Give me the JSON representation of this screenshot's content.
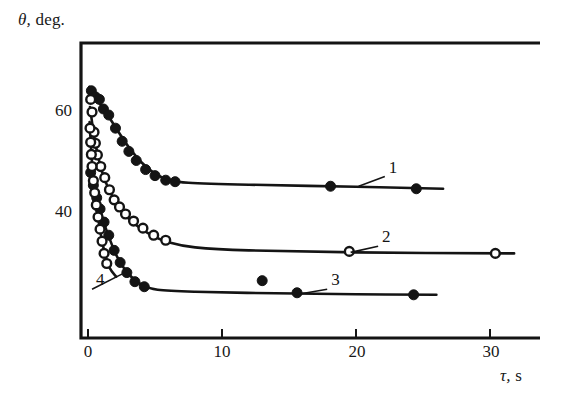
{
  "figure": {
    "background_color": "#ffffff",
    "ink_color": "#141414"
  },
  "axes": {
    "y_title": "θ,",
    "y_title_unit": "deg.",
    "x_title": "τ,",
    "x_title_unit": "s",
    "x_ticks": [
      "0",
      "10",
      "20",
      "30"
    ],
    "y_ticks": [
      "60",
      "40"
    ]
  },
  "curve_labels": [
    {
      "text": "1"
    },
    {
      "text": "2"
    },
    {
      "text": "3"
    },
    {
      "text": "4"
    }
  ],
  "chart_data": {
    "type": "scatter",
    "title": "",
    "subtitle": "",
    "xlabel": "τ, s",
    "ylabel": "θ, deg.",
    "xlim": [
      -0.6,
      33.7
    ],
    "ylim": [
      19.5,
      71.5
    ],
    "x_ticks": [
      0,
      10,
      20,
      30
    ],
    "y_ticks": [
      40,
      60
    ],
    "grid": false,
    "legend": "inline-curve-numbers",
    "annotations": [
      {
        "label": "1",
        "x": 22.3,
        "y": 47.8,
        "points_to": {
          "x": 20.2,
          "y": 45.3
        }
      },
      {
        "label": "2",
        "x": 21.8,
        "y": 34.0,
        "points_to": {
          "x": 19.6,
          "y": 32.2
        }
      },
      {
        "label": "3",
        "x": 18.0,
        "y": 25.5,
        "points_to": {
          "x": 15.9,
          "y": 24.0
        }
      },
      {
        "label": "4",
        "x": 0.45,
        "y": 25.5,
        "points_to": {
          "x": 2.6,
          "y": 28.0
        }
      }
    ],
    "series": [
      {
        "name": "1",
        "marker": "filled-circle",
        "marker_color": "#141414",
        "points": [
          {
            "x": 0.25,
            "y": 64.2
          },
          {
            "x": 0.55,
            "y": 63.0
          },
          {
            "x": 0.85,
            "y": 62.5
          },
          {
            "x": 1.15,
            "y": 60.6
          },
          {
            "x": 1.55,
            "y": 59.4
          },
          {
            "x": 2.05,
            "y": 56.8
          },
          {
            "x": 2.55,
            "y": 54.2
          },
          {
            "x": 3.05,
            "y": 52.2
          },
          {
            "x": 3.6,
            "y": 50.4
          },
          {
            "x": 4.3,
            "y": 48.6
          },
          {
            "x": 5.0,
            "y": 47.4
          },
          {
            "x": 5.8,
            "y": 46.5
          },
          {
            "x": 6.5,
            "y": 46.2
          },
          {
            "x": 18.1,
            "y": 45.3
          },
          {
            "x": 24.5,
            "y": 44.8
          }
        ],
        "fit_curve": [
          {
            "x": 0.1,
            "y": 65.0
          },
          {
            "x": 0.6,
            "y": 62.8
          },
          {
            "x": 1.2,
            "y": 60.5
          },
          {
            "x": 2.0,
            "y": 57.2
          },
          {
            "x": 3.0,
            "y": 53.2
          },
          {
            "x": 4.0,
            "y": 50.0
          },
          {
            "x": 5.0,
            "y": 47.8
          },
          {
            "x": 6.0,
            "y": 46.6
          },
          {
            "x": 7.5,
            "y": 46.0
          },
          {
            "x": 12.0,
            "y": 45.6
          },
          {
            "x": 20.0,
            "y": 45.2
          },
          {
            "x": 26.5,
            "y": 44.8
          }
        ]
      },
      {
        "name": "2",
        "marker": "open-circle",
        "marker_color": "#141414",
        "points": [
          {
            "x": 0.2,
            "y": 62.5
          },
          {
            "x": 0.3,
            "y": 60.0
          },
          {
            "x": 0.45,
            "y": 56.0
          },
          {
            "x": 0.55,
            "y": 53.8
          },
          {
            "x": 0.7,
            "y": 51.5
          },
          {
            "x": 0.95,
            "y": 49.2
          },
          {
            "x": 1.25,
            "y": 47.0
          },
          {
            "x": 1.6,
            "y": 44.6
          },
          {
            "x": 1.95,
            "y": 42.6
          },
          {
            "x": 2.35,
            "y": 41.2
          },
          {
            "x": 2.8,
            "y": 39.8
          },
          {
            "x": 3.4,
            "y": 38.4
          },
          {
            "x": 4.1,
            "y": 37.0
          },
          {
            "x": 4.9,
            "y": 35.6
          },
          {
            "x": 5.8,
            "y": 34.6
          },
          {
            "x": 19.5,
            "y": 32.4
          },
          {
            "x": 30.4,
            "y": 32.0
          }
        ],
        "fit_curve": [
          {
            "x": 0.15,
            "y": 61.0
          },
          {
            "x": 0.5,
            "y": 54.5
          },
          {
            "x": 1.0,
            "y": 48.6
          },
          {
            "x": 1.6,
            "y": 44.4
          },
          {
            "x": 2.4,
            "y": 40.8
          },
          {
            "x": 3.4,
            "y": 38.0
          },
          {
            "x": 4.6,
            "y": 35.8
          },
          {
            "x": 6.0,
            "y": 34.2
          },
          {
            "x": 8.0,
            "y": 33.2
          },
          {
            "x": 12.0,
            "y": 32.6
          },
          {
            "x": 20.0,
            "y": 32.2
          },
          {
            "x": 31.8,
            "y": 32.0
          }
        ]
      },
      {
        "name": "3",
        "marker": "filled-circle",
        "marker_color": "#141414",
        "points": [
          {
            "x": 0.2,
            "y": 48.0
          },
          {
            "x": 0.4,
            "y": 45.5
          },
          {
            "x": 0.65,
            "y": 43.0
          },
          {
            "x": 0.9,
            "y": 40.8
          },
          {
            "x": 1.2,
            "y": 38.2
          },
          {
            "x": 1.55,
            "y": 35.6
          },
          {
            "x": 1.95,
            "y": 32.6
          },
          {
            "x": 2.4,
            "y": 30.2
          },
          {
            "x": 2.9,
            "y": 28.2
          },
          {
            "x": 3.5,
            "y": 26.4
          },
          {
            "x": 4.2,
            "y": 25.4
          },
          {
            "x": 13.0,
            "y": 26.6
          },
          {
            "x": 15.6,
            "y": 24.2
          },
          {
            "x": 24.3,
            "y": 23.8
          }
        ],
        "fit_curve": [
          {
            "x": 0.1,
            "y": 49.0
          },
          {
            "x": 0.5,
            "y": 44.6
          },
          {
            "x": 1.0,
            "y": 39.6
          },
          {
            "x": 1.6,
            "y": 35.0
          },
          {
            "x": 2.2,
            "y": 31.2
          },
          {
            "x": 3.0,
            "y": 28.0
          },
          {
            "x": 4.0,
            "y": 25.8
          },
          {
            "x": 5.2,
            "y": 24.8
          },
          {
            "x": 8.0,
            "y": 24.4
          },
          {
            "x": 14.0,
            "y": 24.1
          },
          {
            "x": 20.0,
            "y": 23.9
          },
          {
            "x": 26.0,
            "y": 23.8
          }
        ]
      },
      {
        "name": "4",
        "marker": "open-circle",
        "marker_color": "#141414",
        "points": [
          {
            "x": 0.15,
            "y": 56.8
          },
          {
            "x": 0.2,
            "y": 54.0
          },
          {
            "x": 0.25,
            "y": 51.6
          },
          {
            "x": 0.3,
            "y": 49.2
          },
          {
            "x": 0.4,
            "y": 46.4
          },
          {
            "x": 0.5,
            "y": 44.0
          },
          {
            "x": 0.62,
            "y": 41.6
          },
          {
            "x": 0.75,
            "y": 39.2
          },
          {
            "x": 0.9,
            "y": 36.8
          },
          {
            "x": 1.05,
            "y": 34.4
          },
          {
            "x": 1.2,
            "y": 32.0
          },
          {
            "x": 1.4,
            "y": 30.0
          }
        ],
        "fit_curve": [
          {
            "x": 0.12,
            "y": 58.0
          },
          {
            "x": 0.3,
            "y": 50.0
          },
          {
            "x": 0.55,
            "y": 43.0
          },
          {
            "x": 0.85,
            "y": 37.4
          },
          {
            "x": 1.2,
            "y": 32.6
          },
          {
            "x": 1.6,
            "y": 29.2
          },
          {
            "x": 2.1,
            "y": 27.4
          }
        ]
      }
    ]
  }
}
